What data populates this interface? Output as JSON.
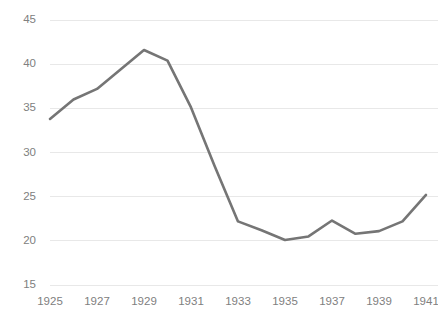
{
  "chart_data": {
    "type": "line",
    "title": "",
    "subtitle": "",
    "xlabel": "",
    "ylabel": "",
    "x": [
      1925,
      1926,
      1927,
      1928,
      1929,
      1930,
      1931,
      1932,
      1933,
      1934,
      1935,
      1936,
      1937,
      1938,
      1939,
      1940,
      1941
    ],
    "values": [
      33.8,
      36.0,
      37.2,
      39.4,
      41.6,
      40.4,
      35.1,
      28.5,
      22.2,
      21.2,
      20.1,
      20.5,
      22.3,
      20.8,
      21.1,
      22.2,
      25.2
    ],
    "series": [
      {
        "name": "",
        "color": "#757575",
        "values": [
          33.8,
          36.0,
          37.2,
          39.4,
          41.6,
          40.4,
          35.1,
          28.5,
          22.2,
          21.2,
          20.1,
          20.5,
          22.3,
          20.8,
          21.1,
          22.2,
          25.2
        ]
      }
    ],
    "xlim": [
      1925,
      1941
    ],
    "ylim": [
      15,
      45
    ],
    "ytick_labels": [
      "45",
      "40",
      "35",
      "30",
      "25",
      "20",
      "15"
    ],
    "ytick_values": [
      45,
      40,
      35,
      30,
      25,
      20,
      15
    ],
    "xtick_labels": [
      "1925",
      "1927",
      "1929",
      "1931",
      "1933",
      "1935",
      "1937",
      "1939",
      "1941"
    ],
    "xtick_values": [
      1925,
      1927,
      1929,
      1931,
      1933,
      1935,
      1937,
      1939,
      1941
    ],
    "grid": "horizontal",
    "legend": "none",
    "annotations": [],
    "colors": {
      "line": "#757575",
      "gridline": "#e8e8e8",
      "tick_label": "#808080",
      "background": "#ffffff"
    }
  }
}
